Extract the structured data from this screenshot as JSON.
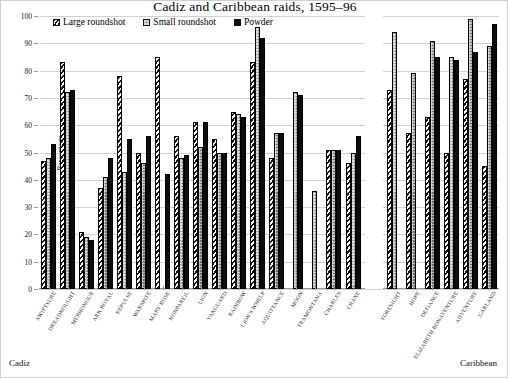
{
  "chart_data": {
    "type": "bar",
    "title": "Cadiz and Caribbean raids, 1595–96",
    "xlabel": "",
    "ylabel": "Percentage",
    "ylim": [
      0,
      100
    ],
    "ytick_step": 10,
    "yticks": [
      0,
      10,
      20,
      30,
      40,
      50,
      60,
      70,
      80,
      90,
      100
    ],
    "ytick_labels": [
      "0",
      "10",
      "20",
      "30",
      "40",
      "50",
      "60",
      "70",
      "80",
      "90",
      "100"
    ],
    "grid": true,
    "legend_position": "top-left inside",
    "legend": [
      "Large roundshot",
      "Small roundshot",
      "Powder"
    ],
    "series": [
      {
        "name": "Large roundshot",
        "fill": "diagonal-hatch",
        "values": [
          47,
          83,
          21,
          37,
          78,
          50,
          85,
          56,
          61,
          55,
          65,
          83,
          48,
          null,
          null,
          51,
          46,
          73,
          57,
          63,
          50,
          77,
          45,
          93
        ]
      },
      {
        "name": "Small roundshot",
        "fill": "gray-crosshatch",
        "values": [
          48,
          72,
          19,
          41,
          43,
          46,
          null,
          48,
          52,
          50,
          64,
          96,
          57,
          72,
          36,
          51,
          50,
          94,
          79,
          91,
          85,
          99,
          89,
          95
        ]
      },
      {
        "name": "Powder",
        "fill": "solid-black",
        "values": [
          53,
          73,
          18,
          48,
          55,
          56,
          42,
          49,
          61,
          50,
          63,
          92,
          57,
          71,
          null,
          51,
          56,
          null,
          null,
          85,
          84,
          87,
          97,
          66
        ]
      }
    ],
    "regions": [
      {
        "caption": "Cadiz",
        "categories": [
          "SWIFTSURE",
          "DREADNOUGHT",
          "MERHONOUR",
          "ARK ROYAL",
          "REPULSE",
          "WARSPITE",
          "MARY ROSE",
          "NONPAREIL",
          "LION",
          "VANGUARD",
          "RAINBOW",
          "LION'S WHELP",
          "AQUITTANCE",
          "MOON",
          "TRAMONTANA",
          "CHARLES",
          "CRANE"
        ],
        "group_values": [
          {
            "large": 47,
            "small": 48,
            "powder": 53
          },
          {
            "large": 83,
            "small": 72,
            "powder": 73
          },
          {
            "large": 21,
            "small": 19,
            "powder": 18
          },
          {
            "large": 37,
            "small": 41,
            "powder": 48
          },
          {
            "large": 78,
            "small": 43,
            "powder": 55
          },
          {
            "large": 50,
            "small": 46,
            "powder": 56
          },
          {
            "large": 85,
            "small": null,
            "powder": 42
          },
          {
            "large": 56,
            "small": 48,
            "powder": 49
          },
          {
            "large": 61,
            "small": 52,
            "powder": 61
          },
          {
            "large": 55,
            "small": 50,
            "powder": 50
          },
          {
            "large": 65,
            "small": 64,
            "powder": 63
          },
          {
            "large": 83,
            "small": 96,
            "powder": 92
          },
          {
            "large": 48,
            "small": 57,
            "powder": 57
          },
          {
            "large": null,
            "small": 72,
            "powder": 71
          },
          {
            "large": null,
            "small": 36,
            "powder": null
          },
          {
            "large": 51,
            "small": 51,
            "powder": 51
          },
          {
            "large": 46,
            "small": 50,
            "powder": 56
          }
        ]
      },
      {
        "caption": "Caribbean",
        "categories": [
          "FORESIGHT",
          "HOPE",
          "DEFIANCE",
          "ELIZABETH BONAVENTURE",
          "ADVENTURE",
          "GARLAND"
        ],
        "group_values": [
          {
            "large": 73,
            "small": 94,
            "powder": null
          },
          {
            "large": 57,
            "small": 79,
            "powder": null
          },
          {
            "large": 63,
            "small": 91,
            "powder": 85
          },
          {
            "large": 50,
            "small": 85,
            "powder": 84
          },
          {
            "large": 77,
            "small": 99,
            "powder": 87
          },
          {
            "large": 45,
            "small": 89,
            "powder": 97
          },
          {
            "large": 93,
            "small": 95,
            "powder": 66
          }
        ]
      }
    ]
  },
  "title": "Cadiz and Caribbean raids, 1595–96",
  "axis": {
    "y_title": "Percentage"
  },
  "legend": {
    "items": [
      {
        "label": "Large roundshot",
        "swatch": "sw-large"
      },
      {
        "label": "Small roundshot",
        "swatch": "sw-small"
      },
      {
        "label": "Powder",
        "swatch": "sw-powder"
      }
    ]
  },
  "regions": {
    "left": "Cadiz",
    "right": "Caribbean"
  }
}
